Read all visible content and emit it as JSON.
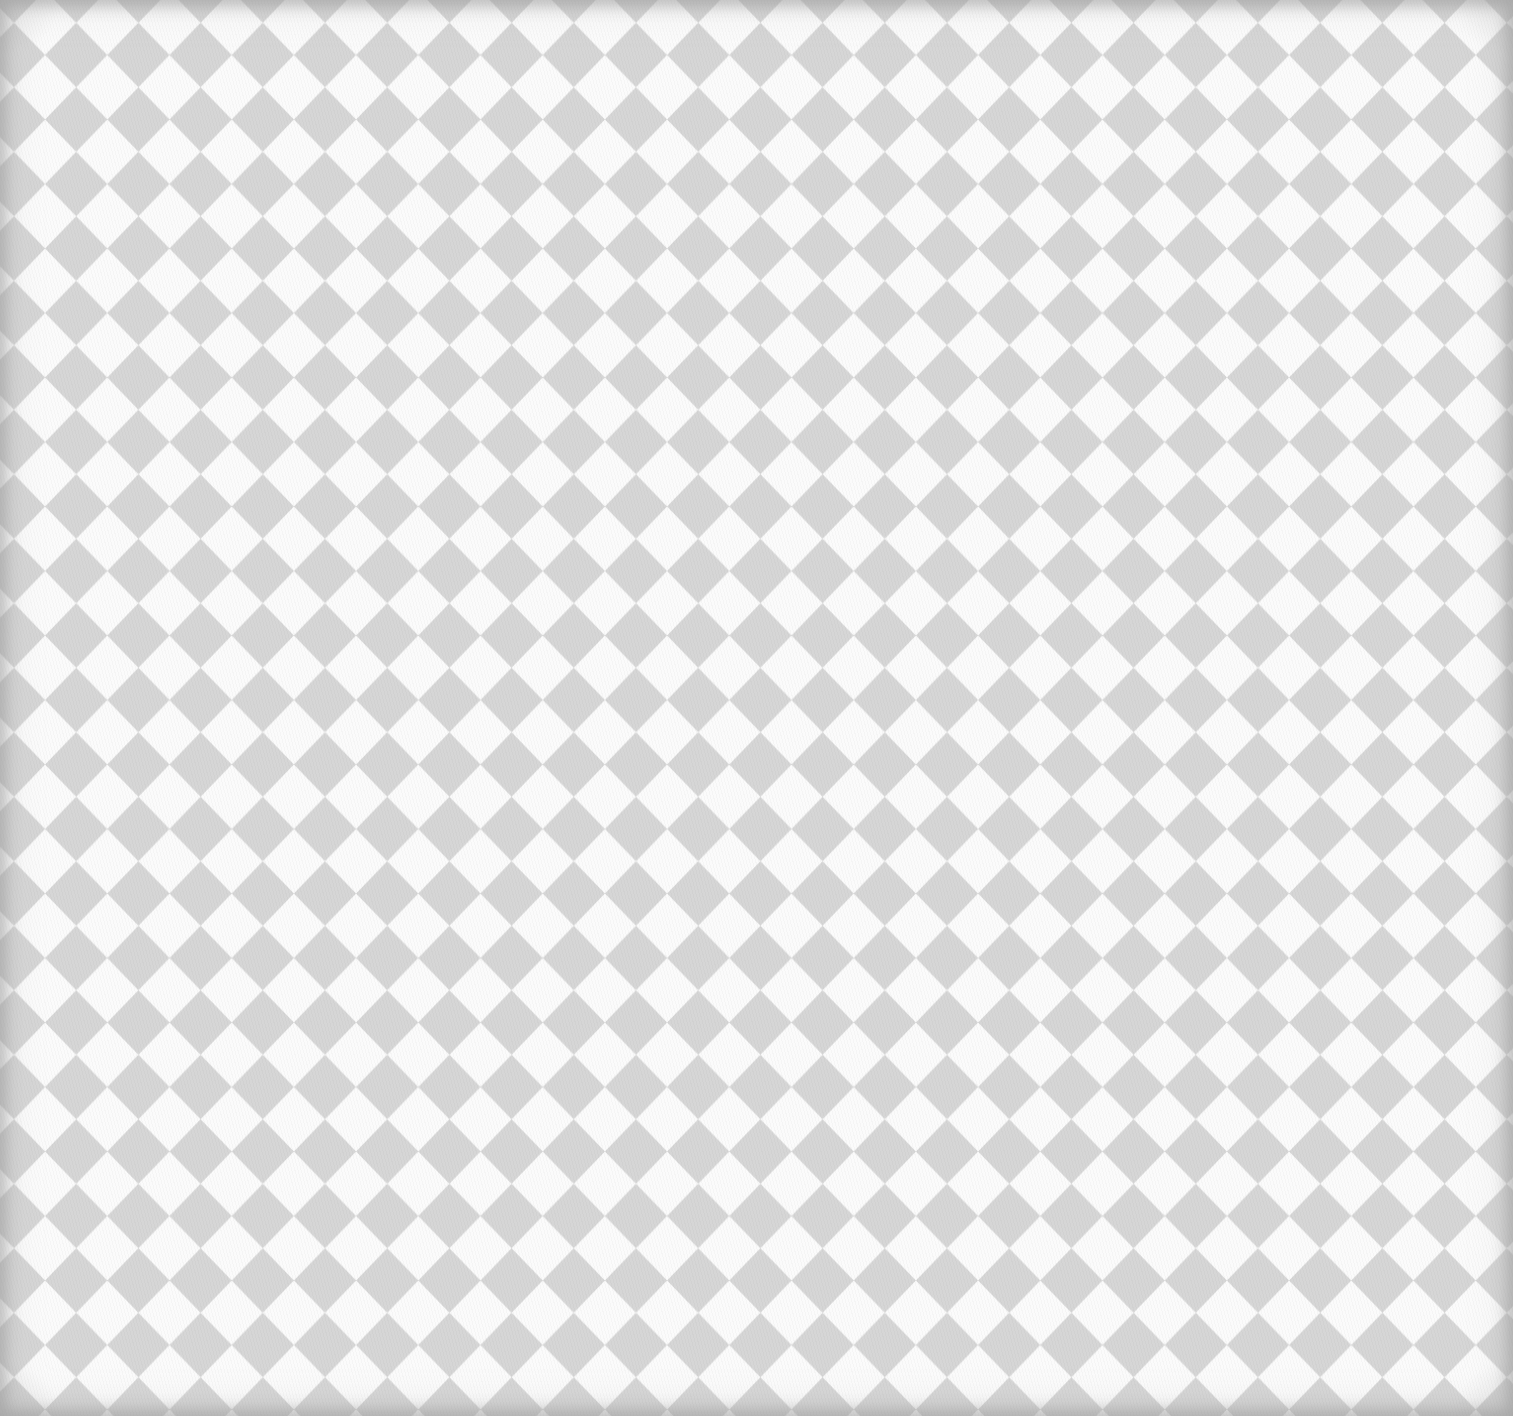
{
  "image": {
    "description": "Harlequin diamond checkered fabric texture",
    "width": 1513,
    "height": 1416
  },
  "pattern": {
    "type": "harlequin-diamond",
    "period_x": 62.2,
    "period_y": 64.5,
    "origin_x": 14,
    "origin_y": 55,
    "diamond_color": "#d6d6d6",
    "background_color": "#fbfbfb",
    "vignette_color": "#c8c8c8"
  }
}
